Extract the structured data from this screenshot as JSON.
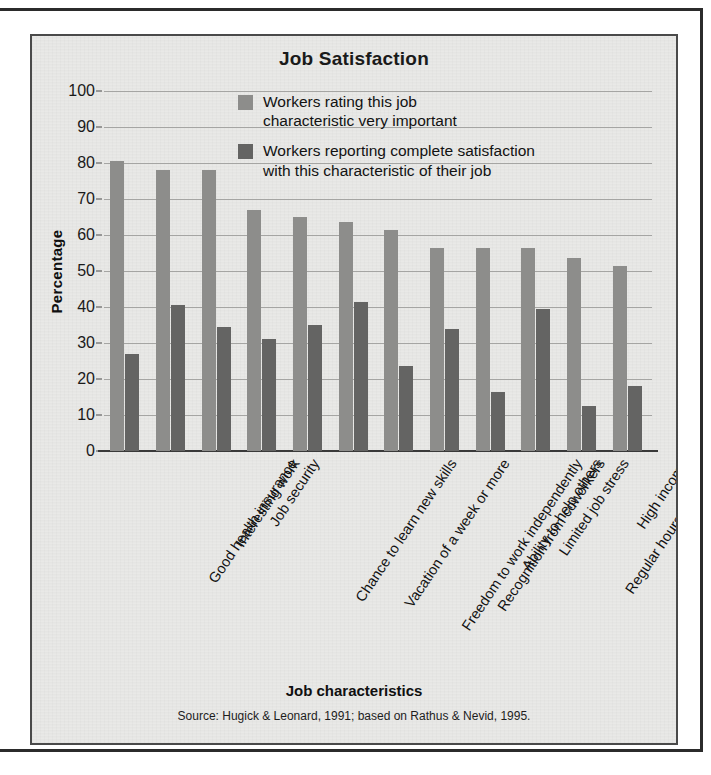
{
  "chart_data": {
    "type": "bar",
    "title": "Job Satisfaction",
    "xlabel": "Job characteristics",
    "ylabel": "Percentage",
    "ylim": [
      0,
      100
    ],
    "yticks": [
      0,
      10,
      20,
      30,
      40,
      50,
      60,
      70,
      80,
      90,
      100
    ],
    "grid": true,
    "legend_position": "inside top-right",
    "categories": [
      "Good health insurance",
      "Interesting work",
      "Job security",
      "Chance to learn new skills",
      "Vacation of a week or more",
      "Freedom to work independently",
      "Recognition from coworkers",
      "Ability to help others",
      "Limited job stress",
      "Regular hours (no nights\nor weekends)",
      "High income",
      "Chances for promotion"
    ],
    "series": [
      {
        "name": "Workers rating this job characteristic very important",
        "color": "#8d8d8b",
        "values": [
          80.5,
          78,
          78,
          67,
          65,
          63.5,
          61.5,
          56.5,
          56.5,
          56.5,
          53.5,
          51.5
        ]
      },
      {
        "name": "Workers reporting complete satisfaction with this characteristic of their job",
        "color": "#646463",
        "values": [
          27,
          40.5,
          34.5,
          31,
          35,
          41.5,
          23.5,
          34,
          16.5,
          39.5,
          12.5,
          18
        ]
      }
    ],
    "legend": [
      {
        "label_line1": "Workers rating this job",
        "label_line2": "characteristic very important",
        "color": "#8d8d8b"
      },
      {
        "label_line1": "Workers reporting complete satisfaction",
        "label_line2": "with this characteristic of their job",
        "color": "#646463"
      }
    ],
    "source_note": "Source: Hugick & Leonard, 1991; based on Rathus & Nevid, 1995."
  }
}
